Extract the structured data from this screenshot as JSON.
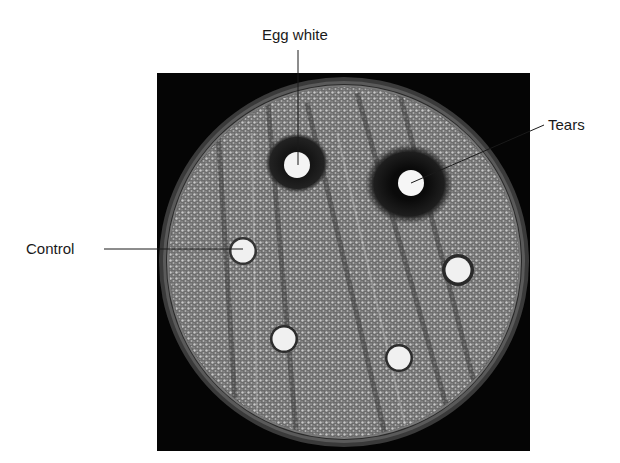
{
  "figure": {
    "labels": {
      "egg_white": "Egg white",
      "tears": "Tears",
      "control": "Control"
    },
    "plate": {
      "description": "Petri dish with bacterial lawn and six filter discs",
      "background_color": "#050505",
      "lawn_color": "#8a8a8a",
      "disc_color": "#f4f4f4",
      "clear_zone_color": "#1c1c1c"
    }
  }
}
